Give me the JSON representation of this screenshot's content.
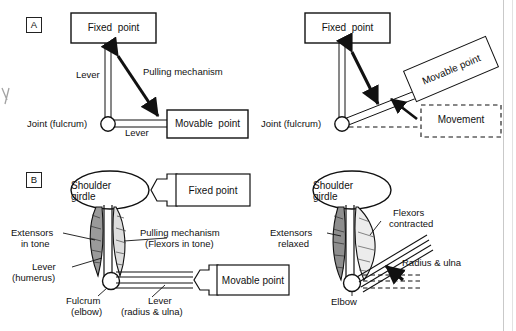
{
  "figure": {
    "page_rule_color": "#c9c9c9"
  },
  "panelA": {
    "tag": "A",
    "left": {
      "fixed_point": "Fixed  point",
      "movable_point": "Movable  point",
      "lever_vertical": "Lever",
      "lever_horizontal": "Lever",
      "joint": "Joint (fulcrum)",
      "pulling_mechanism": "Pulling mechanism"
    },
    "right": {
      "fixed_point": "Fixed  point",
      "movable_point": "Movable point",
      "joint": "Joint (fulcrum)",
      "movement": "Movement"
    }
  },
  "panelB": {
    "tag": "B",
    "left": {
      "shoulder_girdle_line1": "Shoulder",
      "shoulder_girdle_line2": "girdle",
      "fixed_point": "Fixed point",
      "movable_point": "Movable point",
      "extensors_line1": "Extensors",
      "extensors_line2": "in tone",
      "pulling_line1": "Pulling mechanism",
      "pulling_line2": "(Flexors in tone)",
      "lever_line1": "Lever",
      "lever_line2": "(humerus)",
      "fulcrum_line1": "Fulcrum",
      "fulcrum_line2": "(elbow)",
      "lever2_line1": "Lever",
      "lever2_line2": "(radius & ulna)"
    },
    "right": {
      "shoulder_girdle_line1": "Shoulder",
      "shoulder_girdle_line2": "girdle",
      "flexors_line1": "Flexors",
      "flexors_line2": "contracted",
      "extensors_line1": "Extensors",
      "extensors_line2": "relaxed",
      "radius_ulna": "Radius & ulna",
      "elbow": "Elbow"
    }
  },
  "margin_mark": "y"
}
